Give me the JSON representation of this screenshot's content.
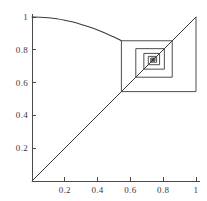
{
  "chart_data": {
    "type": "line",
    "title": "",
    "subtitle": "",
    "xlabel": "",
    "ylabel": "",
    "xlim": [
      0,
      1.06
    ],
    "ylim": [
      0,
      1.06
    ],
    "grid": false,
    "legend": "none",
    "axis_color": "#4a4a4a",
    "curve_color": "#3a3a3a",
    "diagonal_color": "#3a3a3a",
    "cobweb_color": "#3a3a3a",
    "xticks": [
      {
        "value": 0.2,
        "label": "0.2"
      },
      {
        "value": 0.4,
        "label": "0.4"
      },
      {
        "value": 0.6,
        "label": "0.6"
      },
      {
        "value": 0.8,
        "label": "0.8"
      },
      {
        "value": 1.0,
        "label": "1"
      }
    ],
    "yticks": [
      {
        "value": 0.2,
        "label": "0.2"
      },
      {
        "value": 0.4,
        "label": "0.4"
      },
      {
        "value": 0.6,
        "label": "0.6"
      },
      {
        "value": 0.8,
        "label": "0.8"
      },
      {
        "value": 1.0,
        "label": "1"
      }
    ],
    "series": [
      {
        "name": "map-function",
        "type": "curve",
        "description": "decreasing concave map y = f(x)",
        "points": [
          [
            0.0,
            1.0
          ],
          [
            0.05,
            0.999
          ],
          [
            0.1,
            0.995
          ],
          [
            0.15,
            0.989
          ],
          [
            0.2,
            0.98
          ],
          [
            0.25,
            0.969
          ],
          [
            0.3,
            0.955
          ],
          [
            0.35,
            0.939
          ],
          [
            0.4,
            0.921
          ],
          [
            0.45,
            0.9
          ],
          [
            0.5,
            0.878
          ],
          [
            0.545,
            0.855
          ]
        ]
      },
      {
        "name": "identity-line",
        "type": "line",
        "description": "y = x reference diagonal",
        "points": [
          [
            0.0,
            0.0
          ],
          [
            1.0,
            1.0
          ]
        ]
      },
      {
        "name": "cobweb-orbit",
        "type": "polyline",
        "description": "staircase/cobweb iteration spiralling inward to the fixed point",
        "points": [
          [
            1.0,
            1.0
          ],
          [
            1.0,
            0.545
          ],
          [
            0.545,
            0.545
          ],
          [
            0.545,
            0.855
          ],
          [
            0.855,
            0.855
          ],
          [
            0.855,
            0.633
          ],
          [
            0.633,
            0.633
          ],
          [
            0.633,
            0.807
          ],
          [
            0.807,
            0.807
          ],
          [
            0.807,
            0.682
          ],
          [
            0.682,
            0.682
          ],
          [
            0.682,
            0.778
          ],
          [
            0.778,
            0.778
          ],
          [
            0.778,
            0.709
          ],
          [
            0.709,
            0.709
          ],
          [
            0.709,
            0.76
          ],
          [
            0.76,
            0.76
          ],
          [
            0.76,
            0.724
          ],
          [
            0.724,
            0.724
          ],
          [
            0.724,
            0.75
          ],
          [
            0.75,
            0.75
          ],
          [
            0.75,
            0.731
          ],
          [
            0.731,
            0.731
          ],
          [
            0.731,
            0.745
          ],
          [
            0.745,
            0.745
          ],
          [
            0.745,
            0.735
          ],
          [
            0.735,
            0.735
          ],
          [
            0.735,
            0.742
          ],
          [
            0.742,
            0.742
          ],
          [
            0.742,
            0.737
          ],
          [
            0.737,
            0.737
          ],
          [
            0.737,
            0.741
          ],
          [
            0.741,
            0.741
          ],
          [
            0.741,
            0.738
          ],
          [
            0.738,
            0.738
          ],
          [
            0.738,
            0.74
          ],
          [
            0.74,
            0.74
          ],
          [
            0.74,
            0.739
          ],
          [
            0.739,
            0.739
          ]
        ]
      }
    ],
    "fixed_point": [
      0.739,
      0.739
    ]
  }
}
